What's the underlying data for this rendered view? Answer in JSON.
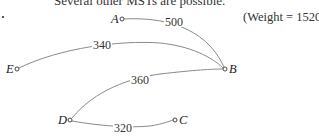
{
  "caption": "Several other MSTs are possible.",
  "weight_text": "(Weight = 1520)",
  "nodes": [
    {
      "id": "A",
      "label": "A",
      "x": 122,
      "y": 19
    },
    {
      "id": "B",
      "label": "B",
      "x": 225,
      "y": 69
    },
    {
      "id": "C",
      "label": "C",
      "x": 175,
      "y": 120
    },
    {
      "id": "D",
      "label": "D",
      "x": 70,
      "y": 120
    },
    {
      "id": "E",
      "label": "E",
      "x": 17,
      "y": 69
    }
  ],
  "edges": [
    {
      "from": "A",
      "to": "B",
      "weight": "500"
    },
    {
      "from": "E",
      "to": "B",
      "weight": "340"
    },
    {
      "from": "D",
      "to": "B",
      "weight": "360"
    },
    {
      "from": "D",
      "to": "C",
      "weight": "320"
    }
  ],
  "total_weight": 1520
}
